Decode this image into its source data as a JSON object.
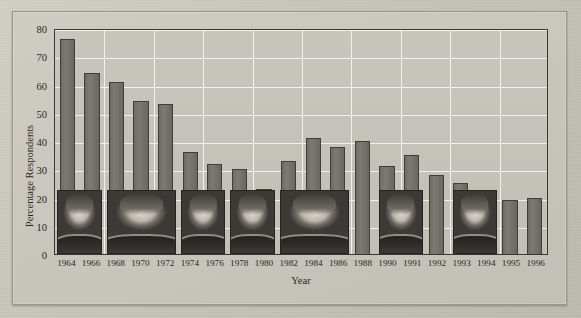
{
  "chart_data": {
    "type": "bar",
    "title": "",
    "xlabel": "Year",
    "ylabel": "Percentage Respondents",
    "ylim": [
      0,
      80
    ],
    "ytick_step": 10,
    "yticks": [
      "80",
      "70",
      "60",
      "50",
      "40",
      "30",
      "20",
      "10",
      "0"
    ],
    "grid": true,
    "legend": "none",
    "categories": [
      "1964",
      "1966",
      "1968",
      "1970",
      "1972",
      "1974",
      "1976",
      "1978",
      "1980",
      "1982",
      "1984",
      "1986",
      "1988",
      "1990",
      "1991",
      "1992",
      "1993",
      "1994",
      "1995",
      "1996"
    ],
    "values": [
      76,
      64,
      61,
      54,
      53,
      36,
      32,
      30,
      23,
      33,
      41,
      38,
      40,
      31,
      35,
      28,
      25,
      22,
      19,
      20
    ],
    "bar_color": "#75726b",
    "bar_edge_color": "#403e39",
    "grid_color": "#f2f0ea",
    "plot_background": "#c5c2b9",
    "page_background": "#c9c6bd",
    "annotations": [
      {
        "name": "lyndon-johnson",
        "label": "Lyndon B. Johnson",
        "start_category": "1964",
        "end_category": "1966"
      },
      {
        "name": "richard-nixon",
        "label": "Richard Nixon",
        "start_category": "1968",
        "end_category": "1972"
      },
      {
        "name": "gerald-ford",
        "label": "Gerald Ford",
        "start_category": "1974",
        "end_category": "1976"
      },
      {
        "name": "jimmy-carter",
        "label": "Jimmy Carter",
        "start_category": "1978",
        "end_category": "1980"
      },
      {
        "name": "ronald-reagan",
        "label": "Ronald Reagan",
        "start_category": "1982",
        "end_category": "1986"
      },
      {
        "name": "george-h-w-bush",
        "label": "George H. W. Bush",
        "start_category": "1990",
        "end_category": "1991"
      },
      {
        "name": "bill-clinton",
        "label": "Bill Clinton",
        "start_category": "1993",
        "end_category": "1994"
      }
    ]
  }
}
